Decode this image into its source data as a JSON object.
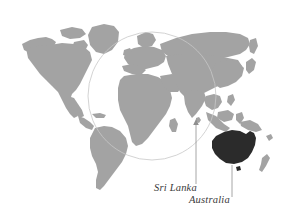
{
  "figure": {
    "type": "world-map-callout",
    "background_color": "#ffffff",
    "width": 285,
    "height": 219
  },
  "map": {
    "landmass_color": "#a3a3a3",
    "highlight_color": "#2b2b2b",
    "outline_color": "#cfcfcf",
    "projection_note": "world map, no Antarctica"
  },
  "highlight": {
    "region_name": "Australia",
    "color": "#2b2b2b"
  },
  "circle": {
    "name": "region-circle",
    "center_x": 152,
    "center_y": 96,
    "radius": 64,
    "stroke_color": "#c8c8c8",
    "stroke_width": 0.7
  },
  "callouts": [
    {
      "id": "sri-lanka",
      "label": "Sri Lanka",
      "leader_line": {
        "x1": 196,
        "y1": 184,
        "x2": 196,
        "y2": 121,
        "arrow": true,
        "color": "#8f8f8f"
      },
      "label_x": 154,
      "label_y": 182
    },
    {
      "id": "australia",
      "label": "Australia",
      "leader_line": {
        "x1": 232,
        "y1": 196,
        "x2": 232,
        "y2": 166,
        "arrow": false,
        "color": "#8f8f8f"
      },
      "label_x": 189,
      "label_y": 194
    }
  ],
  "labels": {
    "sri_lanka": "Sri Lanka",
    "australia": "Australia"
  }
}
